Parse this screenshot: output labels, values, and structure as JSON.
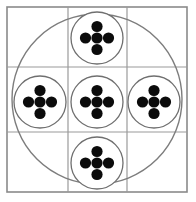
{
  "figure": {
    "title": "Five-circle quincunx grid diagram",
    "canvas": {
      "width": 196,
      "height": 202,
      "background": "#ffffff"
    },
    "colors": {
      "frame_stroke": "#8a8a8a",
      "grid_stroke": "#9a9a9a",
      "big_circle_stroke": "#7d7d7d",
      "small_circle_stroke": "#6f6f6f",
      "dot_fill": "#0b0b0b",
      "background": "#ffffff"
    },
    "outer_frame": {
      "label": "Outer square frame",
      "x": 7,
      "y": 7,
      "width": 180,
      "height": 185,
      "stroke_width": 1.6
    },
    "grid": {
      "label": "3 by 3 grid",
      "rows": 3,
      "columns": 3,
      "vertical_lines_x": [
        68,
        127
      ],
      "horizontal_lines_y": [
        67,
        132
      ],
      "stroke_width": 1.2
    },
    "big_circle": {
      "label": "Large inscribed circle",
      "cx": 97,
      "cy": 99,
      "r": 85,
      "stroke_width": 1.4,
      "fill": "none"
    },
    "small_circles": [
      {
        "name": "top-circle",
        "position": "top",
        "cx": 97,
        "cy": 38,
        "r": 26,
        "stroke_width": 1.3,
        "dot_count": 5,
        "dot_pattern": "plus",
        "dot_radius": 5.6,
        "dot_offset": 11.5
      },
      {
        "name": "left-circle",
        "position": "left",
        "cx": 40,
        "cy": 102,
        "r": 26,
        "stroke_width": 1.3,
        "dot_count": 5,
        "dot_pattern": "plus",
        "dot_radius": 5.6,
        "dot_offset": 11.5
      },
      {
        "name": "center-circle",
        "position": "center",
        "cx": 97,
        "cy": 102,
        "r": 26,
        "stroke_width": 1.3,
        "dot_count": 5,
        "dot_pattern": "plus",
        "dot_radius": 5.6,
        "dot_offset": 11.5
      },
      {
        "name": "right-circle",
        "position": "right",
        "cx": 154,
        "cy": 102,
        "r": 26,
        "stroke_width": 1.3,
        "dot_count": 5,
        "dot_pattern": "plus",
        "dot_radius": 5.6,
        "dot_offset": 11.5
      },
      {
        "name": "bottom-circle",
        "position": "bottom",
        "cx": 97,
        "cy": 163,
        "r": 26,
        "stroke_width": 1.3,
        "dot_count": 5,
        "dot_pattern": "plus",
        "dot_radius": 5.6,
        "dot_offset": 11.5
      }
    ],
    "totals": {
      "small_circle_count": 5,
      "total_dot_count": 25
    }
  }
}
